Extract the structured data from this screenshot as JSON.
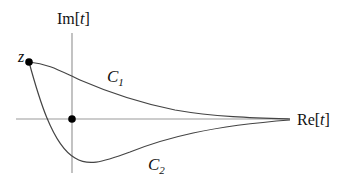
{
  "diagram": {
    "axes": {
      "imag_label_prefix": "Im[",
      "imag_label_var": "t",
      "imag_label_suffix": "]",
      "real_label_prefix": "Re[",
      "real_label_var": "t",
      "real_label_suffix": "]"
    },
    "points": {
      "start_label": "z"
    },
    "contours": [
      {
        "name": "C",
        "subscript": "1"
      },
      {
        "name": "C",
        "subscript": "2"
      }
    ],
    "colors": {
      "axis": "#9a9a9a",
      "curve": "#444444",
      "point": "#000000",
      "text": "#111111"
    }
  }
}
